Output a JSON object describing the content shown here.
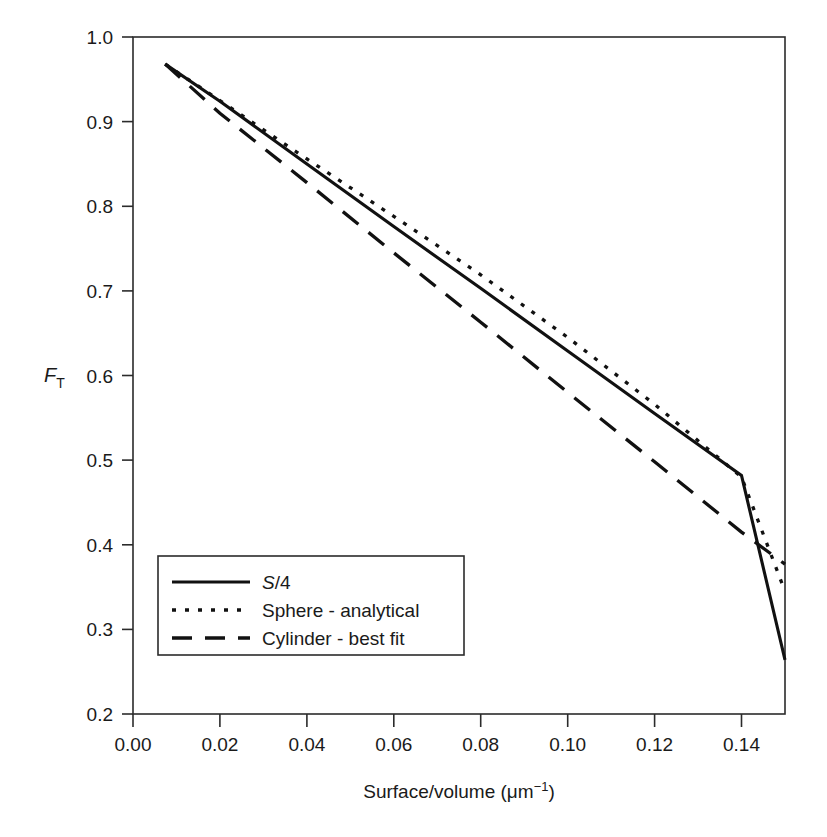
{
  "chart_data": {
    "type": "line",
    "title": "",
    "xlabel": "Surface/volume (μm⁻¹)",
    "xlabel_base": "Surface/volume (",
    "xlabel_unit": "μm",
    "xlabel_exponent": "−1",
    "xlabel_close": ")",
    "ylabel": "F_T",
    "ylabel_base": "F",
    "ylabel_sub": "T",
    "xlim": [
      0.0,
      0.15
    ],
    "ylim": [
      0.2,
      1.0
    ],
    "xticks": [
      0.0,
      0.02,
      0.04,
      0.06,
      0.08,
      0.1,
      0.12,
      0.14
    ],
    "xtick_labels": [
      "0.00",
      "0.02",
      "0.04",
      "0.06",
      "0.08",
      "0.10",
      "0.12",
      "0.14"
    ],
    "yticks": [
      0.2,
      0.3,
      0.4,
      0.5,
      0.6,
      0.7,
      0.8,
      0.9,
      1.0
    ],
    "ytick_labels": [
      "0.2",
      "0.3",
      "0.4",
      "0.5",
      "0.6",
      "0.7",
      "0.8",
      "0.9",
      "1.0"
    ],
    "grid": false,
    "legend_position": "lower-left",
    "series": [
      {
        "name": "S/4",
        "name_italic_part": "S",
        "name_rest": "/4",
        "style": "solid",
        "color": "#111111",
        "x": [
          0.0074,
          0.02,
          0.04,
          0.06,
          0.08,
          0.1,
          0.12,
          0.14,
          0.15
        ],
        "y": [
          0.968,
          0.924,
          0.85,
          0.776,
          0.703,
          0.629,
          0.555,
          0.482,
          0.264
        ]
      },
      {
        "name": "Sphere - analytical",
        "style": "dotted",
        "color": "#111111",
        "x": [
          0.0074,
          0.02,
          0.04,
          0.06,
          0.08,
          0.1,
          0.12,
          0.14,
          0.15
        ],
        "y": [
          0.968,
          0.925,
          0.856,
          0.788,
          0.719,
          0.645,
          0.566,
          0.48,
          0.345
        ]
      },
      {
        "name": "Cylinder - best fit",
        "style": "dashed",
        "color": "#111111",
        "x": [
          0.0074,
          0.02,
          0.04,
          0.06,
          0.08,
          0.1,
          0.12,
          0.14,
          0.15
        ],
        "y": [
          0.968,
          0.91,
          0.828,
          0.745,
          0.663,
          0.58,
          0.498,
          0.415,
          0.377
        ]
      }
    ]
  },
  "legend": {
    "items": [
      {
        "label": "S/4",
        "style": "solid"
      },
      {
        "label": "Sphere - analytical",
        "style": "dotted"
      },
      {
        "label": "Cylinder - best fit",
        "style": "dashed"
      }
    ]
  }
}
